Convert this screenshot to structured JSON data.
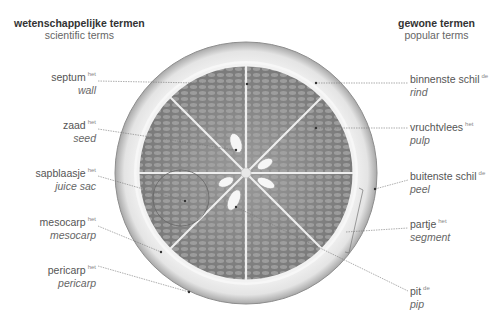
{
  "headers": {
    "left": {
      "title": "wetenschappelijke termen",
      "subtitle": "scientific terms"
    },
    "right": {
      "title": "gewone termen",
      "subtitle": "popular terms"
    }
  },
  "labels_left": [
    {
      "nl": "septum",
      "article": "het",
      "en": "wall"
    },
    {
      "nl": "zaad",
      "article": "het",
      "en": "seed"
    },
    {
      "nl": "sapblaasje",
      "article": "het",
      "en": "juice sac"
    },
    {
      "nl": "mesocarp",
      "article": "het",
      "en": "mesocarp"
    },
    {
      "nl": "pericarp",
      "article": "het",
      "en": "pericarp"
    }
  ],
  "labels_right": [
    {
      "nl": "binnenste schil",
      "article": "de",
      "en": "rind"
    },
    {
      "nl": "vruchtvlees",
      "article": "het",
      "en": "pulp"
    },
    {
      "nl": "buitenste schil",
      "article": "de",
      "en": "peel"
    },
    {
      "nl": "partje",
      "article": "het",
      "en": "segment"
    },
    {
      "nl": "pit",
      "article": "de",
      "en": "pip"
    }
  ],
  "colors": {
    "pulp": "#8a8a8a",
    "pulp_dark": "#6f6f6f",
    "rind": "#f2f2f2",
    "peel_edge": "#9a9a9a",
    "leader_line": "#777777"
  }
}
